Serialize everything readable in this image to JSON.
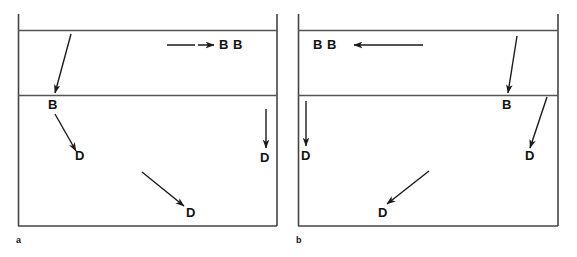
{
  "figure": {
    "domain": "Diagram",
    "background_color": "#ffffff",
    "line_color": "#333333",
    "text_color": "#111111",
    "width": 577,
    "height": 257,
    "panels": [
      {
        "id": "a",
        "caption": "a",
        "caption_pos": {
          "x": 16,
          "y": 236
        },
        "frame": {
          "left": 18,
          "right": 277,
          "top_line_y": 30,
          "mid_line_y": 95,
          "bottom_line_y": 226,
          "vertical_overshoot_top": 16
        },
        "labels": [
          {
            "name": "label-b-top-right",
            "text": "B B",
            "x": 219,
            "y": 39
          },
          {
            "name": "label-b-mid-left",
            "text": "B",
            "x": 48,
            "y": 99
          },
          {
            "name": "label-d-upper-left",
            "text": "D",
            "x": 75,
            "y": 150
          },
          {
            "name": "label-d-lower-middle",
            "text": "D",
            "x": 186,
            "y": 207
          },
          {
            "name": "label-d-right",
            "text": "D",
            "x": 260,
            "y": 152
          }
        ],
        "arrows": [
          {
            "name": "arrow-horizontal-right-top",
            "x1": 167,
            "y1": 45,
            "x2": 214,
            "y2": 45,
            "dashed": true
          },
          {
            "name": "arrow-diagonal-down-to-b",
            "x1": 71,
            "y1": 34,
            "x2": 55,
            "y2": 93
          },
          {
            "name": "arrow-b-to-d-upper-left",
            "x1": 55,
            "y1": 113,
            "x2": 76,
            "y2": 150
          },
          {
            "name": "arrow-diagonal-to-d-lower-middle",
            "x1": 142,
            "y1": 172,
            "x2": 184,
            "y2": 205
          },
          {
            "name": "arrow-vertical-down-right",
            "x1": 266,
            "y1": 109,
            "x2": 266,
            "y2": 147
          }
        ]
      },
      {
        "id": "b",
        "caption": "b",
        "caption_pos": {
          "x": 296,
          "y": 236
        },
        "frame": {
          "left": 298,
          "right": 558,
          "top_line_y": 30,
          "mid_line_y": 95,
          "bottom_line_y": 226,
          "vertical_overshoot_top": 16
        },
        "labels": [
          {
            "name": "label-b-top-left",
            "text": "B B",
            "x": 313,
            "y": 39
          },
          {
            "name": "label-b-mid-right",
            "text": "B",
            "x": 502,
            "y": 99
          },
          {
            "name": "label-d-left",
            "text": "D",
            "x": 302,
            "y": 150
          },
          {
            "name": "label-d-lower-middle",
            "text": "D",
            "x": 378,
            "y": 207
          },
          {
            "name": "label-d-right",
            "text": "D",
            "x": 525,
            "y": 150
          }
        ],
        "arrows": [
          {
            "name": "arrow-horizontal-left-top",
            "x1": 422,
            "y1": 45,
            "x2": 354,
            "y2": 45
          },
          {
            "name": "arrow-diagonal-down-to-b",
            "x1": 516,
            "y1": 36,
            "x2": 508,
            "y2": 93
          },
          {
            "name": "arrow-vertical-down-left",
            "x1": 306,
            "y1": 101,
            "x2": 306,
            "y2": 145
          },
          {
            "name": "arrow-b-to-d-right",
            "x1": 546,
            "y1": 98,
            "x2": 530,
            "y2": 147
          },
          {
            "name": "arrow-diagonal-to-d-lower-middle",
            "x1": 428,
            "y1": 171,
            "x2": 387,
            "y2": 203
          }
        ]
      }
    ]
  }
}
